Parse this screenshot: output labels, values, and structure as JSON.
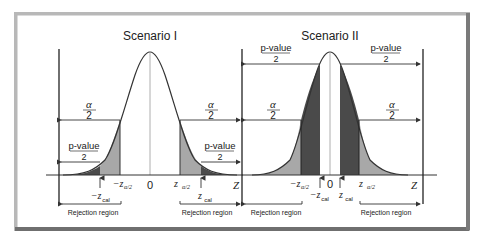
{
  "figure": {
    "panels": [
      {
        "title": "Scenario I",
        "alpha_label": "α",
        "alpha_den": "2",
        "pvalue_label": "p-value",
        "pvalue_den": "2",
        "zero": "0",
        "z_axis": "Z",
        "neg_z_alpha": "−z",
        "pos_z_alpha": "z",
        "alpha_sub": "α/2",
        "neg_z_cal": "−z",
        "pos_z_cal": "z",
        "cal_sub": "cal",
        "rejection_left": "Rejection region",
        "rejection_right": "Rejection region"
      },
      {
        "title": "Scenario II",
        "alpha_label": "α",
        "alpha_den": "2",
        "pvalue_label": "p-value",
        "pvalue_den": "2",
        "zero": "0",
        "z_axis": "Z",
        "neg_z_alpha": "−z",
        "pos_z_alpha": "z",
        "alpha_sub": "α/2",
        "neg_z_cal": "−z",
        "pos_z_cal": "z",
        "cal_sub": "cal",
        "rejection_left": "Rejection region",
        "rejection_right": "Rejection region"
      }
    ],
    "colors": {
      "curve": "#333333",
      "light_shade": "#a8a8a8",
      "dark_shade": "#4a4a4a",
      "frame": "#9a9a9a"
    }
  }
}
